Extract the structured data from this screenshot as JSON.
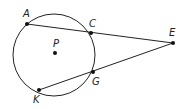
{
  "diagram": {
    "type": "geometry",
    "circle": {
      "center_label": "P",
      "cx": 54,
      "cy": 55,
      "r": 41
    },
    "points": [
      {
        "label": "A",
        "x": 27,
        "y": 24,
        "lx": 23,
        "ly": 17
      },
      {
        "label": "C",
        "x": 91,
        "y": 33,
        "lx": 89,
        "ly": 27
      },
      {
        "label": "E",
        "x": 173,
        "y": 43,
        "lx": 169,
        "ly": 36
      },
      {
        "label": "G",
        "x": 93,
        "y": 72,
        "lx": 92,
        "ly": 84
      },
      {
        "label": "K",
        "x": 39,
        "y": 90,
        "lx": 33,
        "ly": 102
      },
      {
        "label": "P",
        "x": 55,
        "y": 53,
        "lx": 53,
        "ly": 47
      }
    ],
    "segments": [
      {
        "from": "A",
        "to": "E"
      },
      {
        "from": "K",
        "to": "E"
      }
    ],
    "colors": {
      "stroke": "#222222",
      "background": "#ffffff"
    }
  }
}
